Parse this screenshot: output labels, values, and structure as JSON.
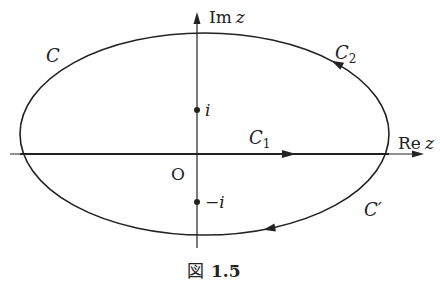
{
  "diagram": {
    "axes": {
      "real_label_prefix": "Re",
      "real_label_var": "z",
      "imag_label_prefix": "Im",
      "imag_label_var": "z",
      "origin_label": "O"
    },
    "points": {
      "i_label": "i",
      "neg_i_label": "−i"
    },
    "curves": {
      "C_label": "C",
      "C1_label": "C",
      "C1_sub": "1",
      "C2_label": "C",
      "C2_sub": "2",
      "Cprime_label": "C′"
    },
    "caption": {
      "prefix": "図",
      "number": "1.5"
    },
    "colors": {
      "stroke": "#222222",
      "background": "#ffffff"
    }
  }
}
